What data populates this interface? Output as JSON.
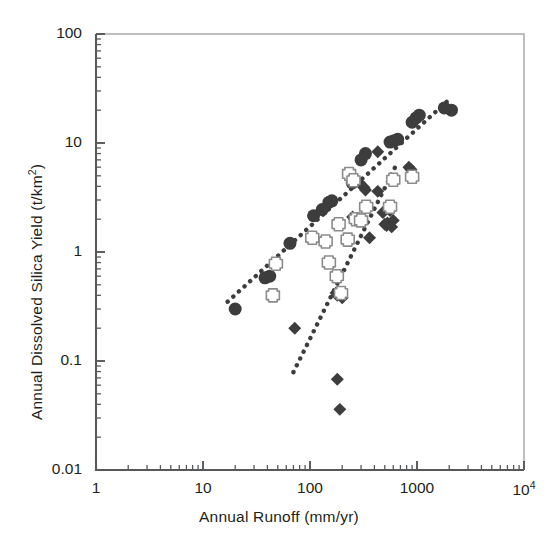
{
  "chart_data": {
    "type": "scatter",
    "title": "",
    "xlabel": "Annual Runoff (mm/yr)",
    "ylabel": "Annual Dissolved Silica Yield (t/km2)",
    "ylabel_base": "Annual Dissolved Silica Yield (t/km",
    "ylabel_sup": "2",
    "ylabel_tail": ")",
    "xscale": "log",
    "yscale": "log",
    "xlim": [
      1,
      10000
    ],
    "ylim": [
      0.01,
      100
    ],
    "grid": false,
    "legend": "none",
    "xticks": [
      {
        "value": 1,
        "label": "1"
      },
      {
        "value": 10,
        "label": "10"
      },
      {
        "value": 100,
        "label": "100"
      },
      {
        "value": 1000,
        "label": "1000"
      },
      {
        "value": 10000,
        "label": "10",
        "sup": "4"
      }
    ],
    "yticks": [
      {
        "value": 100,
        "label": "100"
      },
      {
        "value": 10,
        "label": "10"
      },
      {
        "value": 1,
        "label": "1"
      },
      {
        "value": 0.1,
        "label": "0.1"
      },
      {
        "value": 0.01,
        "label": "0.01"
      }
    ],
    "colors": {
      "marker_fill": "#3d3d3d",
      "cross_fill": "#ffffff",
      "cross_stroke": "#8c8c8c",
      "trendline": "#3d3d3d",
      "axis": "#58595b",
      "text": "#231f20"
    },
    "series": [
      {
        "name": "filled-circles",
        "marker": "circle",
        "fill": "#3d3d3d",
        "size": 13,
        "points": [
          [
            20,
            0.3
          ],
          [
            38,
            0.58
          ],
          [
            42,
            0.6
          ],
          [
            65,
            1.2
          ],
          [
            108,
            2.15
          ],
          [
            130,
            2.45
          ],
          [
            150,
            2.85
          ],
          [
            160,
            2.95
          ],
          [
            235,
            5.2
          ],
          [
            248,
            4.3
          ],
          [
            255,
            4.6
          ],
          [
            300,
            7.0
          ],
          [
            330,
            8.0
          ],
          [
            560,
            10.2
          ],
          [
            610,
            10.5
          ],
          [
            660,
            10.8
          ],
          [
            900,
            15.5
          ],
          [
            980,
            17.0
          ],
          [
            1050,
            18.0
          ],
          [
            1800,
            21.0
          ],
          [
            2100,
            20.0
          ]
        ]
      },
      {
        "name": "filled-diamonds",
        "marker": "diamond",
        "fill": "#3d3d3d",
        "size": 12,
        "points": [
          [
            72,
            0.2
          ],
          [
            175,
            0.42
          ],
          [
            180,
            0.4
          ],
          [
            200,
            0.38
          ],
          [
            180,
            0.068
          ],
          [
            190,
            0.036
          ],
          [
            250,
            2.1
          ],
          [
            260,
            2.0
          ],
          [
            270,
            1.95
          ],
          [
            330,
            3.7
          ],
          [
            360,
            1.35
          ],
          [
            430,
            3.6
          ],
          [
            480,
            2.3
          ],
          [
            500,
            1.8
          ],
          [
            520,
            1.75
          ],
          [
            530,
            1.85
          ],
          [
            560,
            2.4
          ],
          [
            580,
            1.7
          ],
          [
            600,
            1.95
          ],
          [
            290,
            4.3
          ],
          [
            320,
            3.9
          ],
          [
            840,
            6.0
          ],
          [
            880,
            5.7
          ],
          [
            430,
            8.3
          ]
        ]
      },
      {
        "name": "hollow-crosses",
        "marker": "cross",
        "fill": "#ffffff",
        "stroke": "#8c8c8c",
        "size": 13,
        "points": [
          [
            45,
            0.4
          ],
          [
            48,
            0.78
          ],
          [
            105,
            1.35
          ],
          [
            140,
            1.25
          ],
          [
            150,
            0.8
          ],
          [
            178,
            0.6
          ],
          [
            185,
            1.8
          ],
          [
            195,
            0.42
          ],
          [
            225,
            1.3
          ],
          [
            232,
            5.2
          ],
          [
            255,
            4.55
          ],
          [
            268,
            2.0
          ],
          [
            300,
            1.95
          ],
          [
            335,
            2.6
          ],
          [
            560,
            2.6
          ],
          [
            600,
            4.6
          ],
          [
            900,
            4.9
          ]
        ]
      }
    ],
    "trendlines": [
      {
        "name": "circle-trend",
        "style": "dotted",
        "x0": 17,
        "y0": 0.35,
        "x1": 1900,
        "y1": 24.0
      },
      {
        "name": "diamond-trend",
        "style": "dotted",
        "x0": 70,
        "y0": 0.079,
        "x1": 660,
        "y1": 6.7
      }
    ]
  }
}
